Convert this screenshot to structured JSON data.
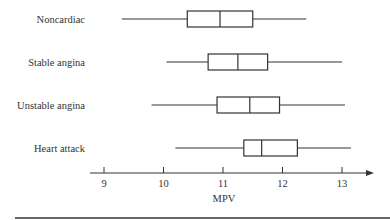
{
  "chart_data": {
    "type": "boxplot",
    "title": "",
    "xlabel": "MPV",
    "ylabel": "",
    "xlim": [
      9,
      13
    ],
    "xticks": [
      9,
      10,
      11,
      12,
      13
    ],
    "grid": false,
    "legend": null,
    "orientation": "horizontal",
    "categories": [
      "Noncardiac",
      "Stable angina",
      "Unstable angina",
      "Heart attack"
    ],
    "series": [
      {
        "name": "Noncardiac",
        "min": 9.3,
        "q1": 10.4,
        "median": 10.95,
        "q3": 11.5,
        "max": 12.4
      },
      {
        "name": "Stable angina",
        "min": 10.05,
        "q1": 10.75,
        "median": 11.25,
        "q3": 11.75,
        "max": 13.0
      },
      {
        "name": "Unstable angina",
        "min": 9.8,
        "q1": 10.9,
        "median": 11.45,
        "q3": 11.95,
        "max": 13.05
      },
      {
        "name": "Heart attack",
        "min": 10.2,
        "q1": 11.35,
        "median": 11.65,
        "q3": 12.25,
        "max": 13.15
      }
    ]
  },
  "colors": {
    "line": "#333333",
    "background": "#ffffff"
  }
}
